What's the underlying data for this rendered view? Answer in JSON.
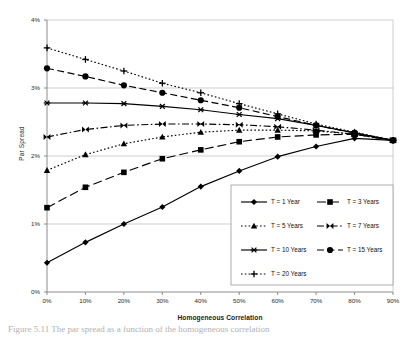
{
  "figure": {
    "caption": "Figure 5.11  The par spread as a function of the homogeneous correlation"
  },
  "axes": {
    "y_title": "Par Spread",
    "x_title": "Homogeneous Correlation",
    "y_ticks": [
      "0%",
      "1%",
      "2%",
      "3%",
      "4%"
    ],
    "x_ticks": [
      "0%",
      "10%",
      "20%",
      "30%",
      "40%",
      "50%",
      "60%",
      "70%",
      "80%",
      "90%"
    ]
  },
  "legend": {
    "items": [
      {
        "label": "T = 1 Year",
        "marker": "diamond-marker",
        "style": "solid"
      },
      {
        "label": "T = 3 Years",
        "marker": "square-marker",
        "style": "long-dash"
      },
      {
        "label": "T = 5 Years",
        "marker": "triangle-marker",
        "style": "dotted"
      },
      {
        "label": "T = 7 Years",
        "marker": "bowtie-marker",
        "style": "dash-dot"
      },
      {
        "label": "T = 10 Years",
        "marker": "asterisk-marker",
        "style": "solid"
      },
      {
        "label": "T = 15 Years",
        "marker": "circle-marker",
        "style": "dashed"
      },
      {
        "label": "T = 20 Years",
        "marker": "plus-marker",
        "style": "dotted"
      }
    ]
  },
  "colors": {
    "line": "#000000",
    "grid": "#b9b9b9",
    "axis": "#808080",
    "legend_border": "#9a9a9a",
    "background": "#ffffff"
  },
  "chart_data": {
    "type": "line",
    "title": "",
    "xlabel": "Homogeneous Correlation",
    "ylabel": "Par Spread",
    "xlim": [
      0,
      90
    ],
    "ylim": [
      0,
      4
    ],
    "x_unit": "percent",
    "y_unit": "percent",
    "grid": true,
    "legend_position": "inside-lower-right",
    "x": [
      0,
      10,
      20,
      30,
      40,
      50,
      60,
      70,
      80,
      90
    ],
    "series": [
      {
        "name": "T = 1 Year",
        "marker": "diamond-marker",
        "style": "solid",
        "values": [
          0.43,
          0.73,
          1.0,
          1.25,
          1.55,
          1.78,
          1.99,
          2.14,
          2.26,
          2.23
        ]
      },
      {
        "name": "T = 3 Years",
        "marker": "square-marker",
        "style": "long-dash",
        "values": [
          1.24,
          1.54,
          1.76,
          1.96,
          2.09,
          2.21,
          2.28,
          2.31,
          2.32,
          2.23
        ]
      },
      {
        "name": "T = 5 Years",
        "marker": "triangle-marker",
        "style": "dotted",
        "values": [
          1.79,
          2.02,
          2.18,
          2.28,
          2.35,
          2.38,
          2.38,
          2.37,
          2.32,
          2.23
        ]
      },
      {
        "name": "T = 7 Years",
        "marker": "bowtie-marker",
        "style": "dash-dot",
        "values": [
          2.28,
          2.39,
          2.45,
          2.47,
          2.47,
          2.46,
          2.43,
          2.38,
          2.32,
          2.23
        ]
      },
      {
        "name": "T = 10 Years",
        "marker": "asterisk-marker",
        "style": "solid",
        "values": [
          2.78,
          2.78,
          2.77,
          2.73,
          2.68,
          2.61,
          2.55,
          2.45,
          2.34,
          2.23
        ]
      },
      {
        "name": "T = 15 Years",
        "marker": "circle-marker",
        "style": "dashed",
        "values": [
          3.29,
          3.17,
          3.04,
          2.93,
          2.82,
          2.71,
          2.58,
          2.45,
          2.34,
          2.23
        ]
      },
      {
        "name": "T = 20 Years",
        "marker": "plus-marker",
        "style": "dotted",
        "values": [
          3.59,
          3.42,
          3.25,
          3.07,
          2.93,
          2.77,
          2.62,
          2.47,
          2.35,
          2.23
        ]
      }
    ]
  }
}
